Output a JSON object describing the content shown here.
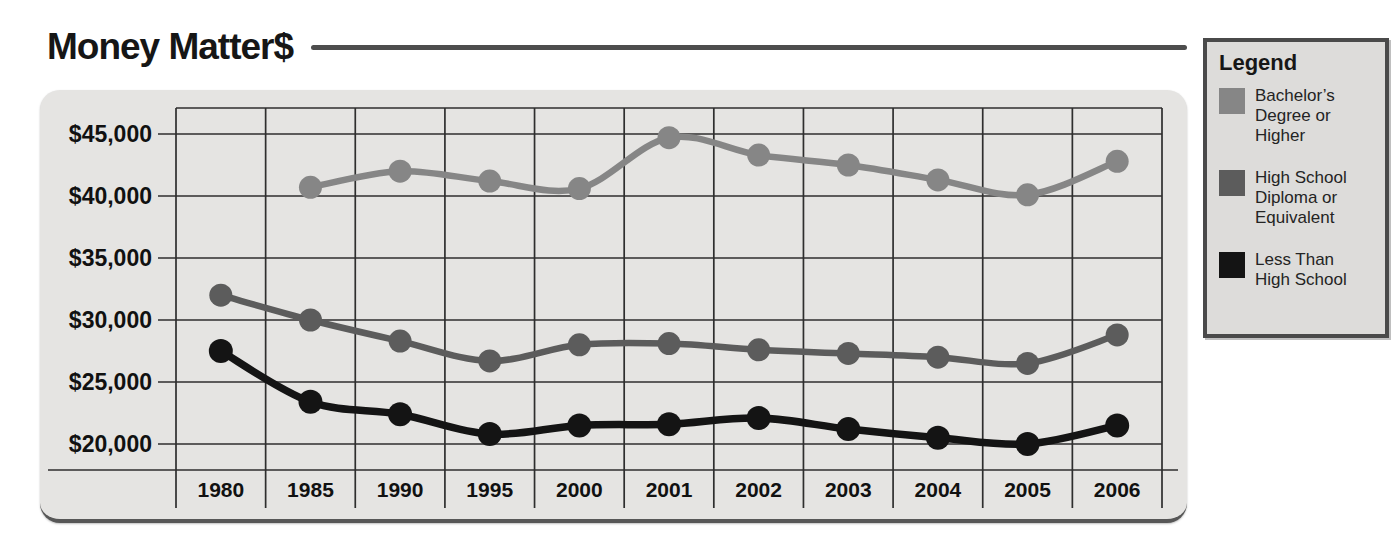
{
  "title": "Money Matter$",
  "legend": {
    "header": "Legend",
    "items": [
      {
        "label": "Bachelor’s Degree or Higher",
        "color": "#868686"
      },
      {
        "label": "High School Diploma or Equivalent",
        "color": "#5c5c5c"
      },
      {
        "label": "Less Than High School",
        "color": "#141414"
      }
    ]
  },
  "chart_data": {
    "type": "line",
    "title": "Money Matter$",
    "x": [
      "1980",
      "1985",
      "1990",
      "1995",
      "2000",
      "2001",
      "2002",
      "2003",
      "2004",
      "2005",
      "2006"
    ],
    "series": [
      {
        "name": "Bachelor’s Degree or Higher",
        "color": "#868686",
        "values": [
          null,
          40700,
          42000,
          41200,
          40600,
          44700,
          43300,
          42500,
          41300,
          40100,
          42800
        ]
      },
      {
        "name": "High School Diploma or Equivalent",
        "color": "#5c5c5c",
        "values": [
          32000,
          30000,
          28300,
          26700,
          28000,
          28100,
          27600,
          27300,
          27000,
          26500,
          28800
        ]
      },
      {
        "name": "Less Than High School",
        "color": "#141414",
        "values": [
          27500,
          23400,
          22400,
          20800,
          21500,
          21600,
          22100,
          21200,
          20500,
          20000,
          21500
        ]
      }
    ],
    "xlabel": "",
    "ylabel": "",
    "ylim": [
      20000,
      45000
    ],
    "yticks": [
      20000,
      25000,
      30000,
      35000,
      40000,
      45000
    ],
    "ytick_prefix": "$",
    "grid": true,
    "legend_position": "right",
    "panel_background": "#e5e4e2",
    "gridline_color": "#2e2e2e"
  }
}
